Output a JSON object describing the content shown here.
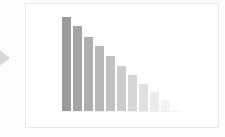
{
  "page": {
    "background_color": "#fdfdfd"
  },
  "arrow_marker": {
    "icon": "arrow-right-icon",
    "color": "#d8d8d8"
  },
  "card": {
    "background_color": "#ffffff",
    "border_color": "#e8e8e8"
  },
  "chart_data": {
    "type": "bar",
    "title": "",
    "subtitle": "",
    "xlabel": "",
    "ylabel": "",
    "grid": false,
    "legend": false,
    "categories": [
      "1",
      "2",
      "3",
      "4",
      "5",
      "6",
      "7",
      "8",
      "9",
      "10"
    ],
    "values": [
      96,
      87,
      76,
      66,
      56,
      46,
      37,
      28,
      19,
      11
    ],
    "ylim": [
      0,
      100
    ],
    "bar_colors": [
      "#9a9a9a",
      "#a4a4a4",
      "#aeaeae",
      "#b8b8b8",
      "#c2c2c2",
      "#cccccc",
      "#d6d6d6",
      "#e0e0e0",
      "#ebebeb",
      "#f4f4f4"
    ],
    "baseline_color": "#f2f2f2"
  }
}
